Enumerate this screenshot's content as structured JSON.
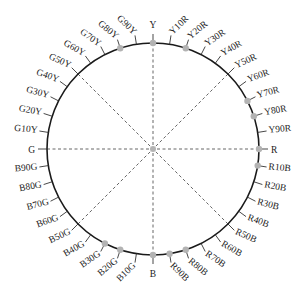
{
  "diagram": {
    "center": [
      153,
      149
    ],
    "radius": 106,
    "colors": {
      "circle": "#1a1a1a",
      "tick": "#333333",
      "dashed": "#555555",
      "marker": "#b3b3b3",
      "label": "#222222"
    },
    "hues": [
      {
        "label": "Y",
        "marked": true
      },
      {
        "label": "Y10R",
        "marked": false
      },
      {
        "label": "Y20R",
        "marked": true
      },
      {
        "label": "Y30R",
        "marked": false
      },
      {
        "label": "Y40R",
        "marked": false
      },
      {
        "label": "Y50R",
        "marked": false
      },
      {
        "label": "Y60R",
        "marked": false
      },
      {
        "label": "Y70R",
        "marked": true
      },
      {
        "label": "Y80R",
        "marked": true
      },
      {
        "label": "Y90R",
        "marked": false
      },
      {
        "label": "R",
        "marked": true
      },
      {
        "label": "R10B",
        "marked": true
      },
      {
        "label": "R20B",
        "marked": false
      },
      {
        "label": "R30B",
        "marked": false
      },
      {
        "label": "R40B",
        "marked": false
      },
      {
        "label": "R50B",
        "marked": false
      },
      {
        "label": "R60B",
        "marked": false
      },
      {
        "label": "R70B",
        "marked": false
      },
      {
        "label": "R80B",
        "marked": true
      },
      {
        "label": "R90B",
        "marked": true
      },
      {
        "label": "B",
        "marked": true
      },
      {
        "label": "B10G",
        "marked": false
      },
      {
        "label": "B20G",
        "marked": true
      },
      {
        "label": "B30G",
        "marked": true
      },
      {
        "label": "B40G",
        "marked": false
      },
      {
        "label": "B50G",
        "marked": false
      },
      {
        "label": "B60G",
        "marked": false
      },
      {
        "label": "B70G",
        "marked": false
      },
      {
        "label": "B80G",
        "marked": false
      },
      {
        "label": "B90G",
        "marked": false
      },
      {
        "label": "G",
        "marked": false
      },
      {
        "label": "G10Y",
        "marked": false
      },
      {
        "label": "G20Y",
        "marked": false
      },
      {
        "label": "G30Y",
        "marked": false
      },
      {
        "label": "G40Y",
        "marked": false
      },
      {
        "label": "G50Y",
        "marked": false
      },
      {
        "label": "G60Y",
        "marked": false
      },
      {
        "label": "G70Y",
        "marked": false
      },
      {
        "label": "G80Y",
        "marked": true
      },
      {
        "label": "G90Y",
        "marked": false
      }
    ],
    "dashed_lines": [
      {
        "from": "Y",
        "to": "B"
      },
      {
        "from": "G",
        "to": "R"
      },
      {
        "from": "G50Y",
        "to": "R50B"
      },
      {
        "from": "Y50R",
        "to": "B50G"
      }
    ]
  }
}
